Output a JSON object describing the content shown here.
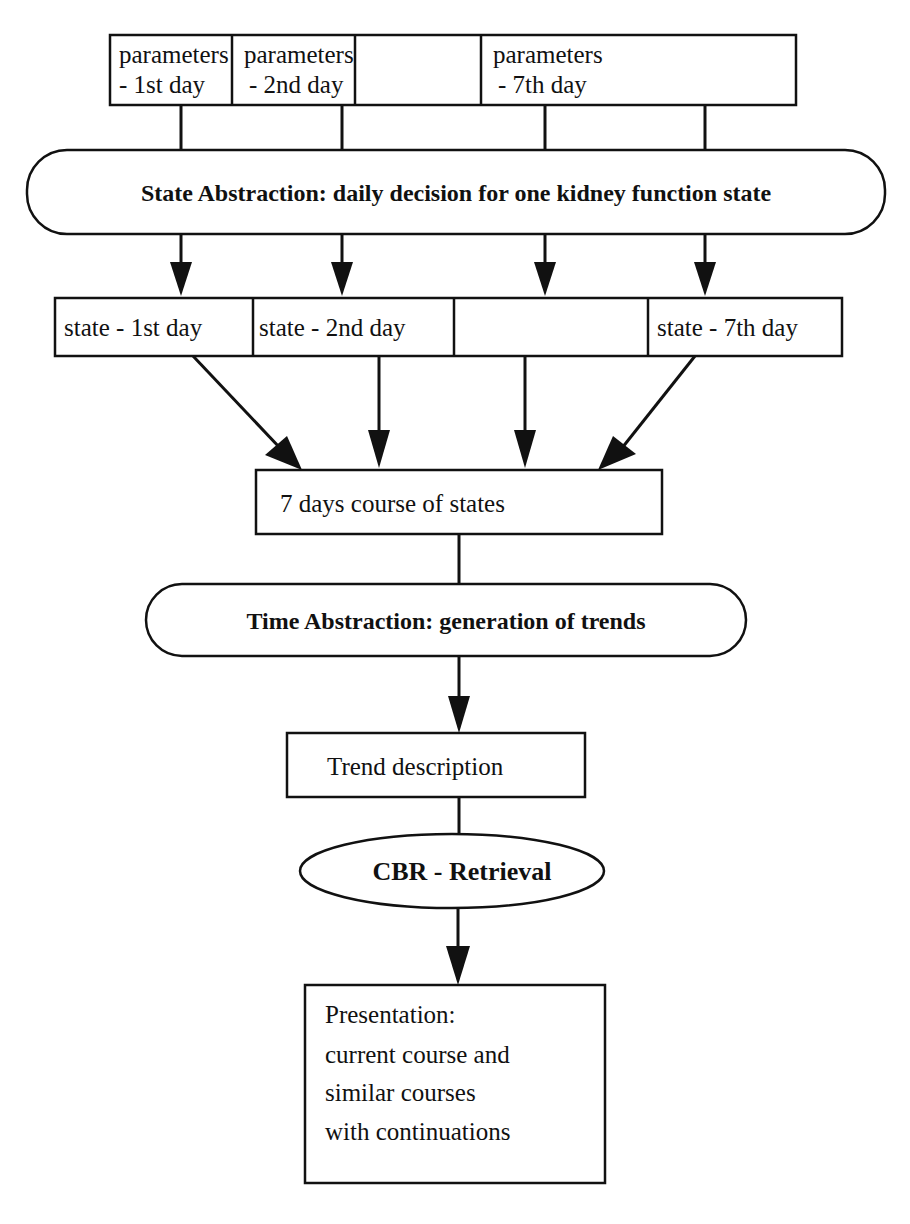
{
  "diagram": {
    "parameters_row": [
      {
        "line1": "parameters",
        "line2": "- 1st day"
      },
      {
        "line1": "parameters",
        "line2": "- 2nd day"
      },
      {
        "line1": "",
        "line2": ""
      },
      {
        "line1": "parameters",
        "line2": "- 7th day"
      }
    ],
    "state_abstraction": "State Abstraction: daily decision for one kidney function state",
    "states_row": [
      "state - 1st day",
      "state - 2nd day",
      "",
      "state - 7th day"
    ],
    "course_of_states": "7 days course of states",
    "time_abstraction": "Time Abstraction: generation of trends",
    "trend_description": "Trend description",
    "cbr_retrieval": "CBR - Retrieval",
    "presentation": [
      "Presentation:",
      "current course and",
      "similar courses",
      "with continuations"
    ]
  }
}
